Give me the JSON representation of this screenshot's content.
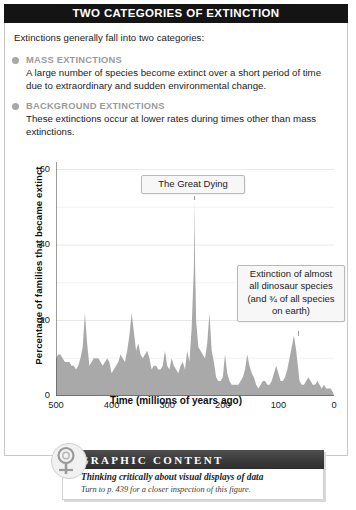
{
  "header": {
    "title": "TWO CATEGORIES OF EXTINCTION"
  },
  "intro": {
    "text": "Extinctions generally fall into two categories:"
  },
  "categories": [
    {
      "heading": "MASS EXTINCTIONS",
      "body": "A large number of species become extinct over a short period of time due to extraordinary and sudden environmental change."
    },
    {
      "heading": "BACKGROUND EXTINCTIONS",
      "body": "These extinctions occur at lower rates during times other than mass extinctions."
    }
  ],
  "callouts": [
    {
      "id": "great-dying",
      "text": "The Great Dying"
    },
    {
      "id": "dinosaur-extinction",
      "text": "Extinction of almost all dinosaur species (and ¾ of all species on earth)"
    }
  ],
  "banner": {
    "title": "GRAPHIC CONTENT",
    "subtitle": "Thinking critically about visual displays of data",
    "note": "Turn to p. 439 for a closer inspection of this figure.",
    "icon": "magnifying-glass-icon"
  },
  "colors": {
    "titlebar_bg": "#141414",
    "heading_gray": "#9a9a9a",
    "bullet_gray": "#a8a8a8",
    "area_fill": "#a9a9a9",
    "grid": "#e8e8e8",
    "banner_bar": "#3b3b3b"
  },
  "chart_data": {
    "type": "area",
    "title": "",
    "xlabel": "Time  (millions of years ago)",
    "ylabel": "Percentage of families that became extinct",
    "xlim": [
      500,
      0
    ],
    "ylim": [
      0,
      62
    ],
    "xticks": [
      500,
      400,
      300,
      200,
      100,
      0
    ],
    "yticks": [
      0,
      20,
      40,
      60
    ],
    "grid": "horizontal",
    "x_reversed": true,
    "legend": "none",
    "annotations": [
      {
        "label": "The Great Dying",
        "x": 251,
        "y": 52
      },
      {
        "label": "Extinction of almost all dinosaur species (and ¾ of all species on earth)",
        "x": 65,
        "y": 17
      }
    ],
    "series": [
      {
        "name": "Percentage of families that became extinct",
        "x": [
          505,
          500,
          496,
          492,
          488,
          484,
          480,
          476,
          472,
          468,
          464,
          460,
          456,
          452,
          448,
          444,
          440,
          436,
          432,
          428,
          424,
          420,
          416,
          412,
          408,
          404,
          400,
          396,
          392,
          388,
          384,
          380,
          376,
          372,
          368,
          364,
          360,
          356,
          352,
          348,
          344,
          340,
          336,
          332,
          328,
          324,
          320,
          316,
          312,
          308,
          304,
          300,
          296,
          292,
          288,
          284,
          280,
          276,
          272,
          268,
          264,
          260,
          256,
          252,
          251,
          250,
          248,
          244,
          240,
          236,
          232,
          228,
          224,
          220,
          216,
          212,
          208,
          204,
          200,
          196,
          192,
          188,
          184,
          180,
          176,
          172,
          168,
          164,
          160,
          156,
          152,
          148,
          144,
          140,
          136,
          132,
          128,
          124,
          120,
          116,
          112,
          108,
          104,
          100,
          96,
          92,
          88,
          84,
          80,
          76,
          72,
          68,
          65,
          62,
          58,
          54,
          50,
          46,
          42,
          38,
          34,
          30,
          26,
          22,
          18,
          14,
          10,
          6,
          2,
          0
        ],
        "y": [
          0,
          10,
          11,
          11,
          10,
          9,
          9,
          9,
          8,
          8,
          7,
          8,
          10,
          13,
          22,
          14,
          8,
          9,
          10,
          10,
          10,
          9,
          8,
          9,
          10,
          9,
          6,
          7,
          8,
          9,
          11,
          10,
          9,
          12,
          16,
          22,
          17,
          12,
          14,
          11,
          10,
          11,
          12,
          10,
          7,
          8,
          8,
          7,
          7,
          8,
          12,
          8,
          7,
          10,
          8,
          7,
          6,
          8,
          9,
          7,
          12,
          9,
          18,
          34,
          52,
          36,
          20,
          13,
          12,
          11,
          10,
          14,
          22,
          12,
          9,
          5,
          4,
          4,
          5,
          11,
          6,
          4,
          3,
          3,
          3,
          3,
          4,
          5,
          7,
          11,
          8,
          6,
          5,
          3,
          2,
          3,
          4,
          4,
          3,
          3,
          4,
          6,
          8,
          6,
          4,
          4,
          5,
          7,
          10,
          13,
          16,
          12,
          8,
          4,
          3,
          3,
          4,
          5,
          4,
          3,
          3,
          4,
          3,
          2,
          3,
          2,
          2,
          2,
          1,
          0
        ]
      }
    ]
  }
}
